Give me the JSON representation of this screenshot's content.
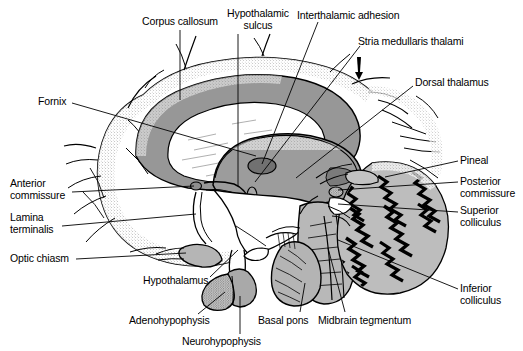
{
  "figure": {
    "type": "anatomical-line-diagram",
    "background_color": "#ffffff",
    "ink_color": "#000000",
    "tones": {
      "thalamus_gray": "#9a9a9a",
      "corpus_callosum_gray": "#8f8f8f",
      "ventricle_white": "#ffffff",
      "brainstem_gray": "#b4b4b4",
      "cerebellum_gray": "#bcbcbc",
      "adhesion_gray": "#6f6f6f",
      "pituitary_gray": "#a8a8a8",
      "stipple_gray": "#7d7d7d"
    }
  },
  "labels": [
    {
      "id": "corpus-callosum",
      "text": "Corpus callosum",
      "lines": [
        "Corpus callosum"
      ],
      "align": "center",
      "x": 180,
      "y": 16,
      "leader": {
        "x1": 180,
        "y1": 30,
        "x2": 180,
        "y2": 100
      }
    },
    {
      "id": "hypothalamic-sulcus",
      "text": "Hypothalamic sulcus",
      "lines": [
        "Hypothalamic",
        "sulcus"
      ],
      "align": "center",
      "x": 258,
      "y": 8,
      "leader": {
        "x1": 238,
        "y1": 34,
        "x2": 238,
        "y2": 186
      }
    },
    {
      "id": "interthalamic-adhesion",
      "text": "Interthalamic adhesion",
      "lines": [
        "Interthalamic adhesion"
      ],
      "align": "left",
      "x": 297,
      "y": 10,
      "leader": {
        "x1": 318,
        "y1": 22,
        "x2": 262,
        "y2": 164
      }
    },
    {
      "id": "stria-medullaris-thalami",
      "text": "Stria medullaris thalami",
      "lines": [
        "Stria medullaris thalami"
      ],
      "align": "left",
      "x": 358,
      "y": 36,
      "leader": {
        "x1": 360,
        "y1": 46,
        "x2": 255,
        "y2": 182
      }
    },
    {
      "id": "dorsal-thalamus",
      "text": "Dorsal thalamus",
      "lines": [
        "Dorsal thalamus"
      ],
      "align": "left",
      "x": 415,
      "y": 77,
      "leader": {
        "x1": 413,
        "y1": 86,
        "x2": 296,
        "y2": 178
      }
    },
    {
      "id": "fornix",
      "text": "Fornix",
      "lines": [
        "Fornix"
      ],
      "align": "left",
      "x": 38,
      "y": 96,
      "leader": {
        "x1": 72,
        "y1": 103,
        "x2": 256,
        "y2": 156
      }
    },
    {
      "id": "pineal",
      "text": "Pineal",
      "lines": [
        "Pineal"
      ],
      "align": "left",
      "x": 460,
      "y": 155,
      "leader": {
        "x1": 458,
        "y1": 161,
        "x2": 385,
        "y2": 177
      }
    },
    {
      "id": "posterior-commissure",
      "text": "Posterior commissure",
      "lines": [
        "Posterior",
        "commissure"
      ],
      "align": "left",
      "x": 460,
      "y": 176,
      "leader": {
        "x1": 458,
        "y1": 182,
        "x2": 338,
        "y2": 190
      }
    },
    {
      "id": "superior-colliculus",
      "text": "Superior colliculus",
      "lines": [
        "Superior",
        "colliculus"
      ],
      "align": "left",
      "x": 460,
      "y": 205,
      "leader": {
        "x1": 458,
        "y1": 212,
        "x2": 338,
        "y2": 204
      }
    },
    {
      "id": "inferior-colliculus",
      "text": "Inferior colliculus",
      "lines": [
        "Inferior",
        "colliculus"
      ],
      "align": "left",
      "x": 460,
      "y": 283,
      "leader": {
        "x1": 458,
        "y1": 289,
        "x2": 338,
        "y2": 240
      }
    },
    {
      "id": "anterior-commissure",
      "text": "Anterior commissure",
      "lines": [
        "Anterior",
        "commissure"
      ],
      "align": "left",
      "x": 10,
      "y": 178,
      "leader": {
        "x1": 72,
        "y1": 192,
        "x2": 194,
        "y2": 186
      }
    },
    {
      "id": "lamina-terminalis",
      "text": "Lamina terminalis",
      "lines": [
        "Lamina",
        "terminalis"
      ],
      "align": "left",
      "x": 10,
      "y": 212,
      "leader": {
        "x1": 62,
        "y1": 226,
        "x2": 196,
        "y2": 214
      }
    },
    {
      "id": "optic-chiasm",
      "text": "Optic chiasm",
      "lines": [
        "Optic chiasm"
      ],
      "align": "left",
      "x": 10,
      "y": 253,
      "leader": {
        "x1": 76,
        "y1": 259,
        "x2": 186,
        "y2": 253
      }
    },
    {
      "id": "hypothalamus",
      "text": "Hypothalamus",
      "lines": [
        "Hypothalamus"
      ],
      "align": "left",
      "x": 143,
      "y": 275,
      "leader": {
        "x1": 210,
        "y1": 277,
        "x2": 238,
        "y2": 250
      }
    },
    {
      "id": "adenohypophysis",
      "text": "Adenohypophysis",
      "lines": [
        "Adenohypophysis"
      ],
      "align": "left",
      "x": 129,
      "y": 315,
      "leader": {
        "x1": 198,
        "y1": 314,
        "x2": 225,
        "y2": 292
      }
    },
    {
      "id": "neurohypophysis",
      "text": "Neurohypophysis",
      "lines": [
        "Neurohypophysis"
      ],
      "align": "left",
      "x": 182,
      "y": 336,
      "leader": {
        "x1": 240,
        "y1": 334,
        "x2": 240,
        "y2": 296
      }
    },
    {
      "id": "basal-pons",
      "text": "Basal pons",
      "lines": [
        "Basal pons"
      ],
      "align": "left",
      "x": 258,
      "y": 315,
      "leader": {
        "x1": 300,
        "y1": 312,
        "x2": 305,
        "y2": 283
      }
    },
    {
      "id": "midbrain-tegmentum",
      "text": "Midbrain tegmentum",
      "lines": [
        "Midbrain tegmentum"
      ],
      "align": "left",
      "x": 318,
      "y": 315,
      "leader": {
        "x1": 345,
        "y1": 312,
        "x2": 328,
        "y2": 248
      }
    }
  ]
}
